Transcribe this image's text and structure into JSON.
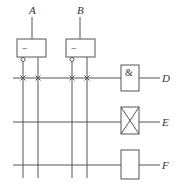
{
  "diagram": {
    "type": "PLA-style logic array",
    "inputs": [
      {
        "label": "A",
        "buffer_symbol": "−"
      },
      {
        "label": "B",
        "buffer_symbol": "−"
      }
    ],
    "outputs": [
      {
        "label": "D",
        "gate_symbol": "&",
        "gate_type": "AND"
      },
      {
        "label": "E",
        "gate_symbol": "",
        "gate_type": "X-box (fuse/crossed)"
      },
      {
        "label": "F",
        "gate_symbol": "",
        "gate_type": "empty box"
      }
    ],
    "connections": {
      "row_D": [
        "A_complement",
        "A_true",
        "B_complement",
        "B_true"
      ],
      "row_E": [],
      "row_F": []
    },
    "colors": {
      "line": "#555555",
      "text": "#333333"
    }
  }
}
